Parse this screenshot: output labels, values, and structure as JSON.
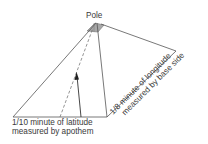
{
  "diagram": {
    "title_label": "Pole",
    "latitude_label": {
      "line1": "1/10 minute of latitude",
      "line2": "measured by apothem"
    },
    "longitude_label": {
      "line1": "1/8 minute of longitude",
      "line2": "measured by base side"
    },
    "colors": {
      "line": "#555555",
      "cap_fill": "#a8a8a8",
      "text": "#3a3a3a"
    }
  }
}
